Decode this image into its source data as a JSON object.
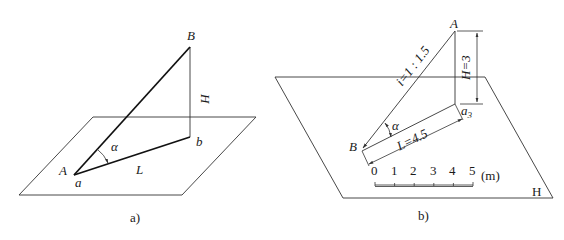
{
  "figure_a": {
    "caption": "a)",
    "labels": {
      "B": "B",
      "H": "H",
      "b": "b",
      "alpha": "α",
      "A": "A",
      "a": "a",
      "L": "L"
    }
  },
  "figure_b": {
    "caption": "b)",
    "labels": {
      "A": "A",
      "H_dim": "H=3",
      "a3_main": "a",
      "a3_sub": "3",
      "slope": "i=1 : 1.5",
      "alpha": "α",
      "L_dim": "L=4.5",
      "B": "B",
      "plane": "H"
    },
    "scale_bar": {
      "ticks": [
        "0",
        "1",
        "2",
        "3",
        "4",
        "5"
      ],
      "unit": "(m)"
    }
  }
}
